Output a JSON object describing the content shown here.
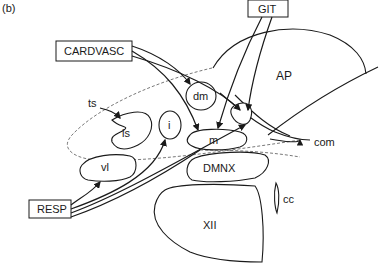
{
  "figure": {
    "panel_label": "(b)"
  },
  "inputs": {
    "cardvasc": "CARDVASC",
    "git": "GIT",
    "resp": "RESP"
  },
  "regions": {
    "ap": "AP",
    "dm": "dm",
    "ts": "ts",
    "is": "is",
    "i": "i",
    "m": "m",
    "vl": "vl",
    "com": "com",
    "dmnx": "DMNX",
    "cc": "cc",
    "xii": "XII"
  }
}
